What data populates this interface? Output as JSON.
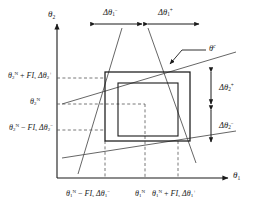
{
  "figure": {
    "type": "technical-diagram"
  },
  "axes": {
    "x_axis_label": "θ",
    "x_axis_sub": "1",
    "y_axis_label": "θ",
    "y_axis_sub": "2"
  },
  "y_labels": [
    {
      "id": "y-upper",
      "base": "θ",
      "base_sub": "2",
      "base_sup": "N",
      "op": "+",
      "factor": "FI",
      "factor_sub": "s",
      "delta": "Δθ",
      "delta_sub": "2",
      "delta_sup": "+",
      "full_text": "θ2N + FIsΔθ2+"
    },
    {
      "id": "y-nominal",
      "base": "θ",
      "base_sub": "2",
      "base_sup": "N",
      "op": "",
      "factor": "",
      "factor_sub": "",
      "delta": "",
      "delta_sub": "",
      "delta_sup": "",
      "full_text": "θ2N"
    },
    {
      "id": "y-lower",
      "base": "θ",
      "base_sub": "2",
      "base_sup": "N",
      "op": "−",
      "factor": "FI",
      "factor_sub": "s",
      "delta": "Δθ",
      "delta_sub": "2",
      "delta_sup": "−",
      "full_text": "θ2N − FIsΔθ2−"
    }
  ],
  "x_labels": [
    {
      "id": "x-left",
      "base": "θ",
      "base_sub": "1",
      "base_sup": "N",
      "op": "−",
      "factor": "FI",
      "factor_sub": "s",
      "delta": "Δθ",
      "delta_sub": "1",
      "delta_sup": "−",
      "full_text": "θ1N − FIsΔθ1−"
    },
    {
      "id": "x-nominal",
      "base": "θ",
      "base_sub": "1",
      "base_sup": "N",
      "op": "",
      "factor": "",
      "factor_sub": "",
      "delta": "",
      "delta_sub": "",
      "delta_sup": "",
      "full_text": "θ1N"
    },
    {
      "id": "x-right",
      "base": "θ",
      "base_sub": "1",
      "base_sup": "N",
      "op": "+",
      "factor": "FI",
      "factor_sub": "s",
      "delta": "Δθ",
      "delta_sub": "1",
      "delta_sup": "+",
      "full_text": "θ1N + FIsΔθ1+"
    }
  ],
  "span_labels": {
    "top_left": {
      "symbol": "Δθ",
      "sub": "1",
      "sup": "−",
      "full_text": "Δθ1−"
    },
    "top_right": {
      "symbol": "Δθ",
      "sub": "1",
      "sup": "+",
      "full_text": "Δθ1+"
    },
    "right_upper": {
      "symbol": "Δθ",
      "sub": "2",
      "sup": "+",
      "full_text": "Δθ2+"
    },
    "right_lower": {
      "symbol": "Δθ",
      "sub": "2",
      "sup": "−",
      "full_text": "Δθ2−"
    }
  },
  "callout": {
    "symbol": "θ",
    "sup": "c",
    "full_text": "θc"
  },
  "colors": {
    "line": "#1a1a1a",
    "constraint_line": "#555555",
    "dashed": "#555555",
    "background": "#ffffff"
  }
}
